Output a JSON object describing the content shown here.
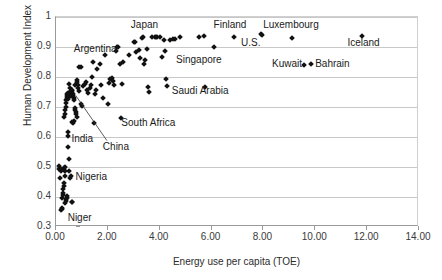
{
  "chart_data": {
    "type": "scatter",
    "title": "",
    "xlabel": "Energy use per capita (TOE)",
    "ylabel": "Human Development Index",
    "xlim": [
      0.0,
      14.0
    ],
    "ylim": [
      0.3,
      1.0
    ],
    "xticks": [
      "0.00",
      "2.00",
      "4.00",
      "6.00",
      "8.00",
      "10.00",
      "12.00",
      "14.00"
    ],
    "xtick_values": [
      0,
      2,
      4,
      6,
      8,
      10,
      12,
      14
    ],
    "yticks": [
      "0.3",
      "0.4",
      "0.5",
      "0.6",
      "0.7",
      "0.8",
      "0.9",
      "1"
    ],
    "ytick_values": [
      0.3,
      0.4,
      0.5,
      0.6,
      0.7,
      0.8,
      0.9,
      1.0
    ],
    "grid": true,
    "grid_axis": "y",
    "legend": false,
    "marker": "diamond",
    "marker_color": "#111111",
    "points": [
      [
        0.1,
        0.505
      ],
      [
        0.12,
        0.495
      ],
      [
        0.15,
        0.462
      ],
      [
        0.18,
        0.492
      ],
      [
        0.2,
        0.488
      ],
      [
        0.21,
        0.357
      ],
      [
        0.23,
        0.36
      ],
      [
        0.24,
        0.365
      ],
      [
        0.25,
        0.397
      ],
      [
        0.26,
        0.406
      ],
      [
        0.27,
        0.413
      ],
      [
        0.28,
        0.428
      ],
      [
        0.29,
        0.436
      ],
      [
        0.3,
        0.448
      ],
      [
        0.31,
        0.49
      ],
      [
        0.32,
        0.497
      ],
      [
        0.33,
        0.5
      ],
      [
        0.34,
        0.486
      ],
      [
        0.35,
        0.47
      ],
      [
        0.36,
        0.38
      ],
      [
        0.38,
        0.392
      ],
      [
        0.4,
        0.388
      ],
      [
        0.42,
        0.404
      ],
      [
        0.44,
        0.398
      ],
      [
        0.46,
        0.566
      ],
      [
        0.47,
        0.604
      ],
      [
        0.48,
        0.618
      ],
      [
        0.5,
        0.527
      ],
      [
        0.52,
        0.486
      ],
      [
        0.55,
        0.465
      ],
      [
        0.58,
        0.47
      ],
      [
        0.6,
        0.383
      ],
      [
        0.62,
        0.385
      ],
      [
        0.3,
        0.668
      ],
      [
        0.33,
        0.676
      ],
      [
        0.35,
        0.69
      ],
      [
        0.37,
        0.7
      ],
      [
        0.38,
        0.712
      ],
      [
        0.4,
        0.722
      ],
      [
        0.42,
        0.731
      ],
      [
        0.43,
        0.738
      ],
      [
        0.44,
        0.744
      ],
      [
        0.45,
        0.748
      ],
      [
        0.46,
        0.74
      ],
      [
        0.47,
        0.735
      ],
      [
        0.48,
        0.728
      ],
      [
        0.5,
        0.742
      ],
      [
        0.52,
        0.746
      ],
      [
        0.53,
        0.75
      ],
      [
        0.55,
        0.745
      ],
      [
        0.56,
        0.738
      ],
      [
        0.58,
        0.742
      ],
      [
        0.6,
        0.747
      ],
      [
        0.61,
        0.752
      ],
      [
        0.62,
        0.758
      ],
      [
        0.64,
        0.744
      ],
      [
        0.66,
        0.737
      ],
      [
        0.68,
        0.73
      ],
      [
        0.7,
        0.722
      ],
      [
        0.72,
        0.698
      ],
      [
        0.74,
        0.69
      ],
      [
        0.76,
        0.683
      ],
      [
        0.78,
        0.676
      ],
      [
        0.8,
        0.668
      ],
      [
        0.5,
        0.778
      ],
      [
        0.55,
        0.765
      ],
      [
        0.6,
        0.65
      ],
      [
        0.65,
        0.647
      ],
      [
        0.7,
        0.652
      ],
      [
        0.75,
        0.772
      ],
      [
        0.8,
        0.79
      ],
      [
        0.82,
        0.783
      ],
      [
        0.84,
        0.775
      ],
      [
        0.86,
        0.765
      ],
      [
        0.88,
        0.755
      ],
      [
        0.9,
        0.833
      ],
      [
        0.95,
        0.833
      ],
      [
        0.98,
        0.71
      ],
      [
        1.0,
        0.705
      ],
      [
        1.05,
        0.77
      ],
      [
        1.1,
        0.776
      ],
      [
        1.15,
        0.782
      ],
      [
        1.2,
        0.757
      ],
      [
        1.25,
        0.748
      ],
      [
        1.3,
        0.765
      ],
      [
        1.35,
        0.772
      ],
      [
        1.4,
        0.8
      ],
      [
        1.42,
        0.85
      ],
      [
        1.45,
        0.648
      ],
      [
        1.5,
        0.743
      ],
      [
        1.55,
        0.757
      ],
      [
        1.6,
        0.826
      ],
      [
        1.7,
        0.844
      ],
      [
        1.75,
        0.775
      ],
      [
        1.8,
        0.73
      ],
      [
        1.9,
        0.872
      ],
      [
        2.0,
        0.711
      ],
      [
        2.05,
        0.78
      ],
      [
        2.1,
        0.792
      ],
      [
        2.15,
        0.796
      ],
      [
        2.2,
        0.788
      ],
      [
        2.25,
        0.775
      ],
      [
        2.3,
        0.886
      ],
      [
        2.35,
        0.899
      ],
      [
        2.4,
        0.899
      ],
      [
        2.45,
        0.845
      ],
      [
        2.5,
        0.663
      ],
      [
        2.55,
        0.777
      ],
      [
        2.6,
        0.85
      ],
      [
        2.8,
        0.875
      ],
      [
        3.0,
        0.916
      ],
      [
        3.05,
        0.918
      ],
      [
        3.1,
        0.884
      ],
      [
        3.2,
        0.89
      ],
      [
        3.25,
        0.863
      ],
      [
        3.3,
        0.93
      ],
      [
        3.35,
        0.933
      ],
      [
        3.4,
        0.843
      ],
      [
        3.45,
        0.856
      ],
      [
        3.5,
        0.892
      ],
      [
        3.55,
        0.766
      ],
      [
        3.6,
        0.751
      ],
      [
        3.7,
        0.933
      ],
      [
        3.8,
        0.934
      ],
      [
        3.85,
        0.935
      ],
      [
        3.9,
        0.933
      ],
      [
        4.0,
        0.935
      ],
      [
        4.1,
        0.868
      ],
      [
        4.15,
        0.923
      ],
      [
        4.2,
        0.886
      ],
      [
        4.25,
        0.792
      ],
      [
        4.3,
        0.769
      ],
      [
        4.4,
        0.925
      ],
      [
        4.5,
        0.928
      ],
      [
        4.6,
        0.927
      ],
      [
        4.8,
        0.935
      ],
      [
        5.5,
        0.935
      ],
      [
        5.7,
        0.937
      ],
      [
        5.75,
        0.766
      ],
      [
        6.1,
        0.9
      ],
      [
        6.85,
        0.934
      ],
      [
        7.9,
        0.942
      ],
      [
        7.95,
        0.94
      ],
      [
        9.1,
        0.93
      ],
      [
        9.55,
        0.84
      ],
      [
        9.85,
        0.842
      ],
      [
        11.8,
        0.938
      ]
    ],
    "annotations": [
      {
        "text": "Japan",
        "x": 3.45,
        "y": 0.975,
        "align": "center"
      },
      {
        "text": "Finland",
        "x": 6.75,
        "y": 0.973,
        "align": "center"
      },
      {
        "text": "Luxembourg",
        "x": 9.1,
        "y": 0.973,
        "align": "center"
      },
      {
        "text": "Iceland",
        "x": 11.9,
        "y": 0.915,
        "align": "center"
      },
      {
        "text": "U.S.",
        "x": 7.55,
        "y": 0.913,
        "align": "center"
      },
      {
        "text": "Argentina",
        "x": 1.55,
        "y": 0.893,
        "align": "center"
      },
      {
        "text": "Singapore",
        "x": 5.55,
        "y": 0.858,
        "align": "center"
      },
      {
        "text": "Kuwait",
        "x": 8.95,
        "y": 0.842,
        "align": "center"
      },
      {
        "text": "Bahrain",
        "x": 10.7,
        "y": 0.845,
        "align": "center"
      },
      {
        "text": "Saudi Arabia",
        "x": 5.6,
        "y": 0.753,
        "align": "center"
      },
      {
        "text": "South Africa",
        "x": 3.6,
        "y": 0.648,
        "align": "center"
      },
      {
        "text": "India",
        "x": 1.05,
        "y": 0.592,
        "align": "center"
      },
      {
        "text": "China",
        "x": 2.35,
        "y": 0.567,
        "align": "center"
      },
      {
        "text": "Nigeria",
        "x": 1.4,
        "y": 0.468,
        "align": "center"
      },
      {
        "text": "Niger",
        "x": 0.95,
        "y": 0.33,
        "align": "center"
      }
    ],
    "leader_lines": [
      {
        "from_label": "China",
        "x1": 2.0,
        "y1": 0.585,
        "x2": 0.8,
        "y2": 0.735
      }
    ]
  }
}
